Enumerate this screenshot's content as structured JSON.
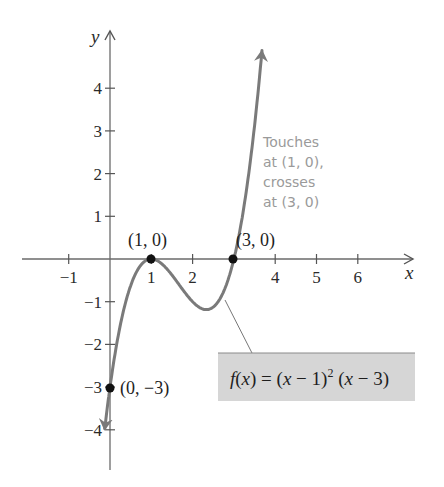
{
  "chart_data": {
    "type": "line",
    "title": "",
    "function": "f(x) = (x - 1)^2 (x - 3)",
    "xlabel": "x",
    "ylabel": "y",
    "xlim": [
      -2,
      7
    ],
    "ylim": [
      -5,
      5
    ],
    "grid": false,
    "x_ticks": [
      -1,
      1,
      2,
      4,
      5,
      6
    ],
    "x_tick_labels": [
      "−1",
      "1",
      "2",
      "4",
      "5",
      "6"
    ],
    "y_ticks": [
      4,
      3,
      2,
      1,
      -1,
      -2,
      -3,
      -4
    ],
    "y_tick_labels": [
      "4",
      "3",
      "2",
      "1",
      "−1",
      "−2",
      "−3",
      "−4"
    ],
    "series": [
      {
        "name": "f(x) = (x − 1)² (x − 3)",
        "x": [
          -0.1,
          0,
          0.25,
          0.5,
          0.75,
          1,
          1.25,
          1.5,
          1.67,
          2,
          2.25,
          2.5,
          2.75,
          3,
          3.25,
          3.5,
          3.7
        ],
        "y": [
          -3.79,
          -3,
          -1.55,
          -0.63,
          -0.14,
          0,
          -0.11,
          -0.38,
          -0.59,
          -1,
          -1.17,
          -1.13,
          -0.77,
          0,
          1.27,
          3.13,
          4.97
        ]
      }
    ],
    "labeled_points": [
      {
        "x": 1,
        "y": 0,
        "label": "(1, 0)"
      },
      {
        "x": 3,
        "y": 0,
        "label": "(3, 0)"
      },
      {
        "x": 0,
        "y": -3,
        "label": "(0, −3)"
      }
    ],
    "annotations": [
      {
        "text": [
          "Touches",
          "at (1, 0),",
          "crosses",
          "at (3, 0)"
        ],
        "near": {
          "x": 3.7,
          "y": 2
        }
      },
      {
        "text": "f(x) = (x − 1)² (x − 3)",
        "type": "callout-box",
        "points_to": {
          "x": 2.7,
          "y": -0.9
        }
      }
    ],
    "colors": {
      "curve": "#7a7a7a",
      "axes": "#555555",
      "points": "#111111",
      "annotation_text": "#9a9a9a",
      "callout_fill": "#d6d6d6"
    }
  },
  "labels": {
    "axis_x": "x",
    "axis_y": "y",
    "point_1": "(1, 0)",
    "point_3": "(3, 0)",
    "point_y": "(0, −3)",
    "annot_lines": [
      "Touches",
      "at (1, 0),",
      "crosses",
      "at (3, 0)"
    ],
    "formula_f": "f",
    "formula_rest1": "(",
    "formula_x1": "x",
    "formula_rest2": ") = (",
    "formula_x2": "x",
    "formula_rest3": " − 1)",
    "formula_sup": "2",
    "formula_rest4": " (",
    "formula_x3": "x",
    "formula_rest5": " − 3)"
  }
}
